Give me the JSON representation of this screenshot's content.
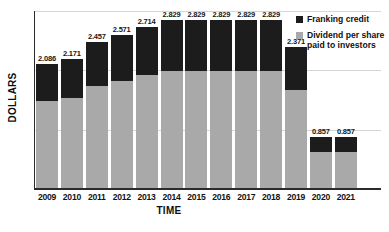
{
  "chart_data": {
    "type": "bar",
    "subtype": "stacked-vertical",
    "title": "",
    "xlabel": "TIME",
    "ylabel": "DOLLARS",
    "ylim": [
      0,
      3
    ],
    "yticks": [
      "0",
      "1",
      "2",
      "3"
    ],
    "grid": true,
    "legend_position": "top-right",
    "categories": [
      "2009",
      "2010",
      "2011",
      "2012",
      "2013",
      "2014",
      "2015",
      "2016",
      "2017",
      "2018",
      "2019",
      "2020",
      "2021"
    ],
    "series": [
      {
        "name": "Dividend per share paid to investors",
        "color": "#a9a9a9",
        "values": [
          1.46,
          1.52,
          1.72,
          1.8,
          1.9,
          1.98,
          1.98,
          1.98,
          1.98,
          1.98,
          1.66,
          0.6,
          0.6
        ]
      },
      {
        "name": "Franking credit",
        "color": "#1c1c1c",
        "values": [
          0.626,
          0.651,
          0.737,
          0.771,
          0.814,
          0.849,
          0.849,
          0.849,
          0.849,
          0.849,
          0.711,
          0.257,
          0.257
        ]
      }
    ],
    "totals": [
      2.086,
      2.171,
      2.457,
      2.571,
      2.714,
      2.829,
      2.829,
      2.829,
      2.829,
      2.829,
      2.371,
      0.857,
      0.857
    ],
    "data_labels": [
      "2.086",
      "2.171",
      "2.457",
      "2.571",
      "2.714",
      "2.829",
      "2.829",
      "2.829",
      "2.829",
      "2.829",
      "2.371",
      "0.857",
      "0.857"
    ]
  },
  "legend": {
    "items": [
      {
        "label": "Franking credit",
        "color": "#1c1c1c"
      },
      {
        "label": "Dividend per share paid to investors",
        "color": "#a9a9a9"
      }
    ]
  },
  "colors": {
    "franking": "#1c1c1c",
    "dividend": "#a9a9a9",
    "grid": "#d6d6d6",
    "axis": "#2b2b2b",
    "background": "#ffffff"
  }
}
